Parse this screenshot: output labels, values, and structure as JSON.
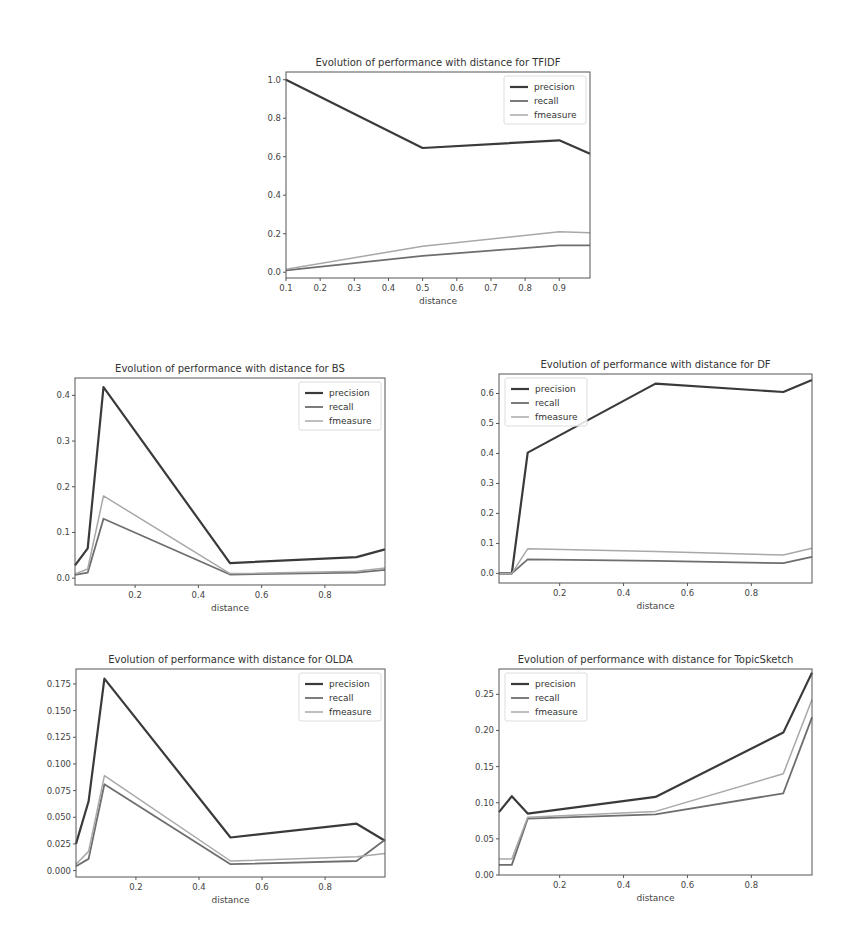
{
  "styles": {
    "precision": {
      "color": "#3a3a3a",
      "width": 2.2
    },
    "recall": {
      "color": "#6e6e6e",
      "width": 1.8
    },
    "fmeasure": {
      "color": "#a8a8a8",
      "width": 1.5
    }
  },
  "chart_data": [
    {
      "id": "tfidf",
      "type": "line",
      "title": "Evolution of performance with distance for TFIDF",
      "xlabel": "distance",
      "ylabel": "",
      "layout": {
        "left": 286,
        "top": 72,
        "right": 590,
        "bottom": 278
      },
      "xlim": [
        0.1,
        0.99
      ],
      "ylim": [
        -0.03,
        1.04
      ],
      "xticks": [
        0.1,
        0.2,
        0.3,
        0.4,
        0.5,
        0.6,
        0.7,
        0.8,
        0.9
      ],
      "xtick_labels": [
        "0.1",
        "0.2",
        "0.3",
        "0.4",
        "0.5",
        "0.6",
        "0.7",
        "0.8",
        "0.9"
      ],
      "yticks": [
        0.0,
        0.2,
        0.4,
        0.6,
        0.8,
        1.0
      ],
      "ytick_labels": [
        "0.0",
        "0.2",
        "0.4",
        "0.6",
        "0.8",
        "1.0"
      ],
      "legend": {
        "position": "upper right",
        "entries": [
          "precision",
          "recall",
          "fmeasure"
        ]
      },
      "x": [
        0.1,
        0.5,
        0.9,
        0.99
      ],
      "series": [
        {
          "name": "precision",
          "values": [
            1.0,
            0.645,
            0.685,
            0.615
          ]
        },
        {
          "name": "recall",
          "values": [
            0.01,
            0.085,
            0.14,
            0.14
          ]
        },
        {
          "name": "fmeasure",
          "values": [
            0.015,
            0.135,
            0.21,
            0.205
          ]
        }
      ]
    },
    {
      "id": "bs",
      "type": "line",
      "title": "Evolution of performance with distance for BS",
      "xlabel": "distance",
      "ylabel": "",
      "layout": {
        "left": 75,
        "top": 378,
        "right": 385,
        "bottom": 585
      },
      "xlim": [
        0.01,
        0.99
      ],
      "ylim": [
        -0.015,
        0.438
      ],
      "xticks": [
        0.2,
        0.4,
        0.6,
        0.8
      ],
      "xtick_labels": [
        "0.2",
        "0.4",
        "0.6",
        "0.8"
      ],
      "yticks": [
        0.0,
        0.1,
        0.2,
        0.3,
        0.4
      ],
      "ytick_labels": [
        "0.0",
        "0.1",
        "0.2",
        "0.3",
        "0.4"
      ],
      "legend": {
        "position": "upper right",
        "entries": [
          "precision",
          "recall",
          "fmeasure"
        ]
      },
      "x": [
        0.01,
        0.05,
        0.1,
        0.5,
        0.9,
        0.99
      ],
      "series": [
        {
          "name": "precision",
          "values": [
            0.028,
            0.065,
            0.418,
            0.033,
            0.046,
            0.063
          ]
        },
        {
          "name": "recall",
          "values": [
            0.007,
            0.012,
            0.13,
            0.008,
            0.012,
            0.018
          ]
        },
        {
          "name": "fmeasure",
          "values": [
            0.009,
            0.02,
            0.18,
            0.01,
            0.015,
            0.022
          ]
        }
      ]
    },
    {
      "id": "df",
      "type": "line",
      "title": "Evolution of performance with distance for DF",
      "xlabel": "distance",
      "ylabel": "",
      "layout": {
        "left": 499,
        "top": 374,
        "right": 812,
        "bottom": 583
      },
      "xlim": [
        0.01,
        0.99
      ],
      "ylim": [
        -0.032,
        0.665
      ],
      "xticks": [
        0.2,
        0.4,
        0.6,
        0.8
      ],
      "xtick_labels": [
        "0.2",
        "0.4",
        "0.6",
        "0.8"
      ],
      "yticks": [
        0.0,
        0.1,
        0.2,
        0.3,
        0.4,
        0.5,
        0.6
      ],
      "ytick_labels": [
        "0.0",
        "0.1",
        "0.2",
        "0.3",
        "0.4",
        "0.5",
        "0.6"
      ],
      "legend": {
        "position": "upper left",
        "entries": [
          "precision",
          "recall",
          "fmeasure"
        ]
      },
      "x": [
        0.01,
        0.05,
        0.1,
        0.5,
        0.9,
        0.99
      ],
      "series": [
        {
          "name": "precision",
          "values": [
            0.0,
            0.0,
            0.403,
            0.633,
            0.605,
            0.645
          ]
        },
        {
          "name": "recall",
          "values": [
            0.0,
            0.0,
            0.047,
            0.042,
            0.034,
            0.055
          ]
        },
        {
          "name": "fmeasure",
          "values": [
            0.0,
            0.0,
            0.082,
            0.073,
            0.061,
            0.084
          ]
        }
      ]
    },
    {
      "id": "olda",
      "type": "line",
      "title": "Evolution of performance with distance for OLDA",
      "xlabel": "distance",
      "ylabel": "",
      "layout": {
        "left": 76,
        "top": 669,
        "right": 385,
        "bottom": 877
      },
      "xlim": [
        0.01,
        0.99
      ],
      "ylim": [
        -0.006,
        0.189
      ],
      "xticks": [
        0.2,
        0.4,
        0.6,
        0.8
      ],
      "xtick_labels": [
        "0.2",
        "0.4",
        "0.6",
        "0.8"
      ],
      "yticks": [
        0.0,
        0.025,
        0.05,
        0.075,
        0.1,
        0.125,
        0.15,
        0.175
      ],
      "ytick_labels": [
        "0.000",
        "0.025",
        "0.050",
        "0.075",
        "0.100",
        "0.125",
        "0.150",
        "0.175"
      ],
      "legend": {
        "position": "upper right",
        "entries": [
          "precision",
          "recall",
          "fmeasure"
        ]
      },
      "x": [
        0.01,
        0.05,
        0.1,
        0.5,
        0.9,
        0.99
      ],
      "series": [
        {
          "name": "precision",
          "values": [
            0.025,
            0.065,
            0.18,
            0.031,
            0.044,
            0.028
          ]
        },
        {
          "name": "recall",
          "values": [
            0.004,
            0.011,
            0.081,
            0.006,
            0.009,
            0.029
          ]
        },
        {
          "name": "fmeasure",
          "values": [
            0.006,
            0.018,
            0.089,
            0.009,
            0.013,
            0.016
          ]
        }
      ]
    },
    {
      "id": "topicsketch",
      "type": "line",
      "title": "Evolution of performance with distance for TopicSketch",
      "xlabel": "distance",
      "ylabel": "",
      "layout": {
        "left": 499,
        "top": 669,
        "right": 812,
        "bottom": 875
      },
      "xlim": [
        0.01,
        0.99
      ],
      "ylim": [
        0.0,
        0.285
      ],
      "xticks": [
        0.2,
        0.4,
        0.6,
        0.8
      ],
      "xtick_labels": [
        "0.2",
        "0.4",
        "0.6",
        "0.8"
      ],
      "yticks": [
        0.0,
        0.05,
        0.1,
        0.15,
        0.2,
        0.25
      ],
      "ytick_labels": [
        "0.00",
        "0.05",
        "0.10",
        "0.15",
        "0.20",
        "0.25"
      ],
      "legend": {
        "position": "upper left",
        "entries": [
          "precision",
          "recall",
          "fmeasure"
        ]
      },
      "x": [
        0.01,
        0.05,
        0.1,
        0.5,
        0.9,
        0.99
      ],
      "series": [
        {
          "name": "precision",
          "values": [
            0.087,
            0.109,
            0.085,
            0.108,
            0.197,
            0.28
          ]
        },
        {
          "name": "recall",
          "values": [
            0.014,
            0.014,
            0.078,
            0.084,
            0.113,
            0.218
          ]
        },
        {
          "name": "fmeasure",
          "values": [
            0.022,
            0.022,
            0.08,
            0.088,
            0.14,
            0.243
          ]
        }
      ]
    }
  ]
}
